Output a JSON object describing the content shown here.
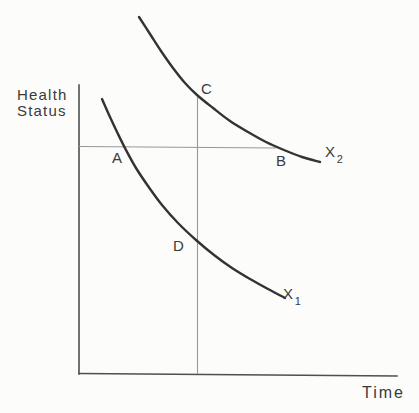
{
  "figure": {
    "type": "conceptual-line-diagram"
  },
  "colors": {
    "background": "#fcfcfa",
    "axis": "#4f4f4f",
    "reference_line": "#979797",
    "curve": "#333333",
    "text": "#3a3a3a"
  },
  "labels": {
    "y_axis_title": {
      "line1": "Health",
      "line2": "Status",
      "x": 17,
      "y": 87
    },
    "x_axis_title": {
      "text": "Time",
      "x": 362,
      "y": 385
    },
    "point_a": {
      "text": "A",
      "x": 112,
      "y": 150
    },
    "point_b": {
      "text": "B",
      "x": 276,
      "y": 153
    },
    "point_c": {
      "text": "C",
      "x": 201,
      "y": 81
    },
    "point_d": {
      "text": "D",
      "x": 173,
      "y": 238
    },
    "curve_x1": {
      "base": "X",
      "sub": "1",
      "x": 283,
      "y": 286
    },
    "curve_x2": {
      "base": "X",
      "sub": "2",
      "x": 325,
      "y": 144
    }
  },
  "geometry": {
    "lines": [
      {
        "name": "y-axis",
        "x1": 79,
        "y1": 85,
        "x2": 79,
        "y2": 374,
        "cls": "axis-line"
      },
      {
        "name": "x-axis",
        "x1": 79,
        "y1": 373.5,
        "x2": 397,
        "y2": 376,
        "cls": "axis-line"
      },
      {
        "name": "ref-horizontal-ab",
        "x1": 79,
        "y1": 146.5,
        "x2": 276,
        "y2": 148,
        "cls": "ref-line"
      },
      {
        "name": "ref-vertical-cd",
        "x1": 197.5,
        "y1": 97,
        "x2": 197.5,
        "y2": 374,
        "cls": "ref-line"
      }
    ],
    "curves": [
      {
        "name": "curve-x2",
        "points": [
          [
            139,
            17
          ],
          [
            150,
            34
          ],
          [
            161,
            51
          ],
          [
            173,
            68
          ],
          [
            185,
            83
          ],
          [
            197,
            95
          ],
          [
            213,
            108
          ],
          [
            230,
            121
          ],
          [
            248,
            132
          ],
          [
            266,
            142
          ],
          [
            284,
            150
          ],
          [
            302,
            157
          ],
          [
            320,
            162
          ]
        ]
      },
      {
        "name": "curve-x1",
        "points": [
          [
            102,
            99
          ],
          [
            110,
            117
          ],
          [
            118,
            134
          ],
          [
            126,
            150
          ],
          [
            136,
            168
          ],
          [
            148,
            186
          ],
          [
            162,
            205
          ],
          [
            178,
            223
          ],
          [
            196,
            240
          ],
          [
            214,
            255
          ],
          [
            232,
            268
          ],
          [
            250,
            279
          ],
          [
            268,
            289
          ],
          [
            285,
            298
          ]
        ]
      }
    ]
  }
}
